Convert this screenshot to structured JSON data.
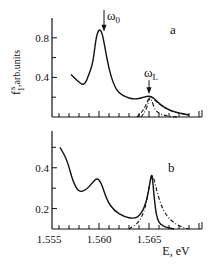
{
  "chart_data": [
    {
      "type": "line",
      "panel_label": "a",
      "ylabel": "f₁ˢ, arb.units",
      "ylabel_main": "f",
      "ylabel_sup": "s",
      "ylabel_sub": "1",
      "ylabel_rest": ",arb.units",
      "xlabel": "",
      "xlim": [
        1.5553,
        1.5703
      ],
      "ylim": [
        0.0,
        1.0
      ],
      "yticks": [
        0.4,
        0.8
      ],
      "ytick_labels": [
        "0.4",
        "0.8"
      ],
      "yminor": [
        0.2,
        0.6
      ],
      "annotations": [
        {
          "text": "ω",
          "sub": "0",
          "x": 1.5605,
          "y": 0.86,
          "arrow": true
        },
        {
          "text": "ω",
          "sub": "L",
          "x": 1.565,
          "y": 0.23,
          "arrow": true
        }
      ],
      "series": [
        {
          "name": "solid",
          "style": "solid",
          "x": [
            1.5572,
            1.5578,
            1.5585,
            1.559,
            1.5594,
            1.5597,
            1.56,
            1.5603,
            1.5606,
            1.561,
            1.5615,
            1.562,
            1.5627,
            1.5635,
            1.5642,
            1.5648,
            1.5652,
            1.5656,
            1.5662,
            1.567,
            1.568,
            1.569
          ],
          "y": [
            0.43,
            0.37,
            0.31,
            0.43,
            0.55,
            0.8,
            0.89,
            0.86,
            0.7,
            0.48,
            0.32,
            0.24,
            0.2,
            0.18,
            0.19,
            0.21,
            0.21,
            0.18,
            0.12,
            0.07,
            0.04,
            0.02
          ]
        },
        {
          "name": "dashed",
          "style": "dashed",
          "x": [
            1.5638,
            1.5643,
            1.5647,
            1.565,
            1.5652,
            1.5655,
            1.566,
            1.5668,
            1.5678,
            1.569
          ],
          "y": [
            0.0,
            0.05,
            0.12,
            0.2,
            0.21,
            0.18,
            0.13,
            0.08,
            0.04,
            0.02
          ]
        },
        {
          "name": "dash-dot",
          "style": "dashdot",
          "x": [
            1.5642,
            1.5646,
            1.5649,
            1.5651,
            1.5653,
            1.5656,
            1.5661,
            1.5668,
            1.5678
          ],
          "y": [
            0.0,
            0.05,
            0.13,
            0.21,
            0.16,
            0.07,
            0.03,
            0.01,
            0.0
          ]
        }
      ]
    },
    {
      "type": "line",
      "panel_label": "b",
      "xlabel": "E, eV",
      "ylabel": "",
      "xlim": [
        1.5553,
        1.5703
      ],
      "ylim": [
        0.1,
        0.58
      ],
      "xticks": [
        1.555,
        1.56,
        1.565
      ],
      "xtick_labels": [
        "1.555",
        "1.560",
        "1.565"
      ],
      "yticks": [
        0.2,
        0.4
      ],
      "ytick_labels": [
        "0.2",
        "0.4"
      ],
      "yminor": [
        0.3,
        0.5
      ],
      "series": [
        {
          "name": "solid",
          "style": "solid",
          "x": [
            1.5561,
            1.5568,
            1.5574,
            1.558,
            1.5587,
            1.5594,
            1.5598,
            1.5602,
            1.5608,
            1.5615,
            1.5625,
            1.5635,
            1.5642,
            1.5648,
            1.5651,
            1.5653,
            1.5655,
            1.5658,
            1.5665,
            1.5675
          ],
          "y": [
            0.5,
            0.44,
            0.33,
            0.28,
            0.29,
            0.33,
            0.35,
            0.33,
            0.24,
            0.19,
            0.16,
            0.15,
            0.17,
            0.24,
            0.33,
            0.38,
            0.26,
            0.14,
            0.11,
            0.1
          ]
        },
        {
          "name": "dash-dot",
          "style": "dashdot",
          "x": [
            1.563,
            1.564,
            1.5647,
            1.5651,
            1.5654,
            1.5658,
            1.5664,
            1.5672,
            1.5682,
            1.569
          ],
          "y": [
            0.1,
            0.13,
            0.21,
            0.34,
            0.37,
            0.28,
            0.19,
            0.14,
            0.11,
            0.1
          ]
        }
      ]
    }
  ]
}
